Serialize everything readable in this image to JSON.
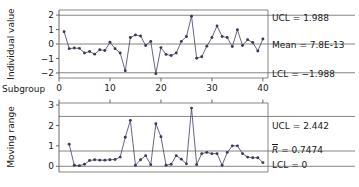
{
  "chart_data": [
    {
      "type": "line",
      "id": "individuals-chart",
      "title": "",
      "ylabel": "Individual value",
      "xlabel": "Subgroup",
      "xlim": [
        0,
        41
      ],
      "ylim": [
        -2.35,
        2.35
      ],
      "xticks": [
        0,
        10,
        20,
        30,
        40
      ],
      "yticks": [
        2,
        1,
        0,
        -1,
        -2
      ],
      "grid": false,
      "x": [
        1,
        2,
        3,
        4,
        5,
        6,
        7,
        8,
        9,
        10,
        11,
        12,
        13,
        14,
        15,
        16,
        17,
        18,
        19,
        20,
        21,
        22,
        23,
        24,
        25,
        26,
        27,
        28,
        29,
        30,
        31,
        32,
        33,
        34,
        35,
        36,
        37,
        38,
        39,
        40
      ],
      "values": [
        0.85,
        -0.32,
        -0.28,
        -0.3,
        -0.62,
        -0.52,
        -0.7,
        -0.4,
        -0.45,
        0.12,
        -0.32,
        -0.62,
        -1.85,
        0.45,
        0.62,
        0.55,
        -0.1,
        0.18,
        -2.05,
        -0.25,
        -0.72,
        -0.8,
        -0.62,
        0.18,
        0.52,
        1.92,
        -0.98,
        -0.88,
        -0.15,
        0.45,
        1.25,
        0.52,
        0.45,
        -0.18,
        0.98,
        -0.1,
        0.3,
        0.1,
        -0.48,
        0.35
      ],
      "limits": [
        {
          "name": "UCL",
          "label": "UCL = 1.988",
          "value": 1.988
        },
        {
          "name": "Mean",
          "label": "Mean = 7.8E-13",
          "value": 0.0
        },
        {
          "name": "LCL",
          "label": "LCL = −1.988",
          "value": -1.988
        }
      ]
    },
    {
      "type": "line",
      "id": "moving-range-chart",
      "title": "",
      "ylabel": "Moving range",
      "xlabel": "",
      "xlim": [
        0,
        41
      ],
      "ylim": [
        -0.28,
        3.1
      ],
      "xticks": [
        0,
        10,
        20,
        30,
        40
      ],
      "yticks": [
        3,
        2,
        1,
        0
      ],
      "grid": false,
      "x": [
        2,
        3,
        4,
        5,
        6,
        7,
        8,
        9,
        10,
        11,
        12,
        13,
        14,
        15,
        16,
        17,
        18,
        19,
        20,
        21,
        22,
        23,
        24,
        25,
        26,
        27,
        28,
        29,
        30,
        31,
        32,
        33,
        34,
        35,
        36,
        37,
        38,
        39,
        40
      ],
      "values": [
        1.08,
        0.05,
        0.03,
        0.1,
        0.28,
        0.32,
        0.3,
        0.3,
        0.32,
        0.33,
        0.45,
        1.42,
        2.25,
        0.05,
        0.32,
        0.52,
        0.08,
        2.08,
        1.45,
        0.05,
        0.1,
        0.52,
        0.35,
        0.12,
        2.85,
        0.08,
        0.62,
        0.68,
        0.62,
        0.62,
        0.05,
        0.68,
        1.0,
        1.0,
        0.62,
        0.45,
        0.42,
        0.42,
        0.18
      ],
      "limits": [
        {
          "name": "UCL",
          "label": "UCL = 2.442",
          "value": 2.442
        },
        {
          "name": "Rbar",
          "label_prefix": "R",
          "label_suffix": " = 0.7474",
          "value": 0.7474
        },
        {
          "name": "LCL",
          "label": "LCL = 0",
          "value": 0.0
        }
      ]
    }
  ],
  "annotations": {
    "top_ucl": "UCL = 1.988",
    "top_mean": "Mean = 7.8E-13",
    "top_lcl": "LCL = −1.988",
    "bottom_ucl": "UCL = 2.442",
    "bottom_rbar_symbol": "R",
    "bottom_rbar_value": " = 0.7474",
    "bottom_lcl": "LCL = 0",
    "subgroup": "Subgroup"
  },
  "axes": {
    "top_ylabel": "Individual value",
    "bottom_ylabel": "Moving range",
    "top_yticks": [
      "2",
      "1",
      "0",
      "−1",
      "−2"
    ],
    "bottom_yticks": [
      "3",
      "2",
      "1",
      "0"
    ],
    "xticks": [
      "0",
      "10",
      "20",
      "30",
      "40"
    ]
  },
  "colors": {
    "series": "#3a3a55",
    "line": "#4a4a6a",
    "axis": "#444444",
    "limit": "#666666",
    "background": "#ffffff"
  }
}
